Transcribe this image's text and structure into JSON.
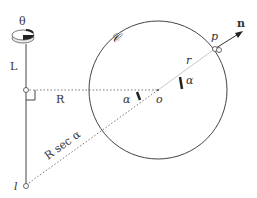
{
  "diagram": {
    "labels": {
      "theta": "θ",
      "L": "L",
      "R": "R",
      "circle": "𝒞",
      "r": "r",
      "p": "p",
      "n": "n",
      "alpha_left": "α",
      "alpha_right": "α",
      "o": "o",
      "Rsec": "R sec α",
      "l": "l"
    },
    "colors": {
      "line": "#444444",
      "dotted": "#777777",
      "background": "#ffffff"
    }
  }
}
